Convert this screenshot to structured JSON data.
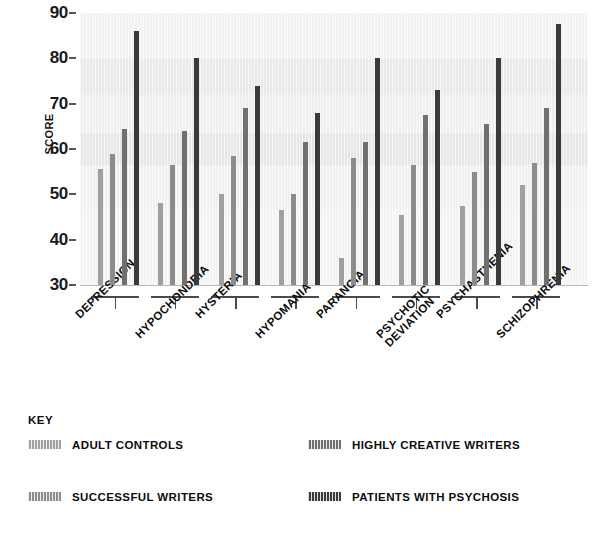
{
  "chart_data": {
    "type": "bar",
    "title": "",
    "xlabel": "",
    "ylabel": "SCORE",
    "ylim": [
      30,
      90
    ],
    "ytick_step": 10,
    "yticks": [
      30,
      40,
      50,
      60,
      70,
      80,
      90
    ],
    "grid": false,
    "legend_position": "bottom",
    "categories": [
      "DEPRESSION",
      "HYPOCHONDRIA",
      "HYSTERIA",
      "HYPOMANIA",
      "PARANOIA",
      "PSYCHOTIC DEVIATION",
      "PSYCHASTHENIA",
      "SCHIZOPHRENIA"
    ],
    "series": [
      {
        "name": "ADULT CONTROLS",
        "color": "#a0a0a0",
        "values": [
          55.5,
          48,
          50,
          46.5,
          36,
          45.5,
          47.5,
          52
        ]
      },
      {
        "name": "SUCCESSFUL WRITERS",
        "color": "#8c8c8c",
        "values": [
          59,
          56.5,
          58.5,
          50,
          58,
          56.5,
          55,
          57
        ]
      },
      {
        "name": "HIGHLY CREATIVE WRITERS",
        "color": "#707070",
        "values": [
          64.5,
          64,
          69,
          61.5,
          61.5,
          67.5,
          65.5,
          69
        ]
      },
      {
        "name": "PATIENTS WITH PSYCHOSIS",
        "color": "#3a3a3a",
        "values": [
          86,
          80,
          74,
          68,
          80,
          73,
          80,
          87.5
        ]
      }
    ]
  },
  "axis": {
    "y_title": "SCORE"
  },
  "legend": {
    "title": "KEY",
    "entries": [
      {
        "label": "ADULT CONTROLS",
        "color": "#a0a0a0"
      },
      {
        "label": "HIGHLY CREATIVE WRITERS",
        "color": "#707070"
      },
      {
        "label": "SUCCESSFUL WRITERS",
        "color": "#8c8c8c"
      },
      {
        "label": "PATIENTS WITH PSYCHOSIS",
        "color": "#3a3a3a"
      }
    ]
  }
}
